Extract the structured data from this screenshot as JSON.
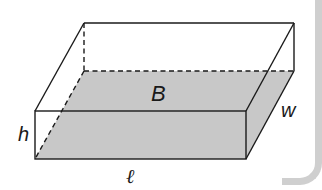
{
  "figure": {
    "labels": {
      "base": "B",
      "width": "w",
      "height": "h",
      "length": "ℓ"
    },
    "colors": {
      "line": "#1a1a1a",
      "base_fill": "#c8c8c8",
      "background": "#ffffff",
      "panel_edge": "#cfcfcf"
    },
    "vertices": {
      "front_top_left": [
        35,
        111
      ],
      "front_top_right": [
        246,
        111
      ],
      "front_bottom_left": [
        35,
        159
      ],
      "front_bottom_right": [
        246,
        159
      ],
      "back_top_left": [
        84,
        23
      ],
      "back_top_right": [
        294,
        23
      ],
      "back_bottom_left": [
        84,
        71
      ],
      "back_bottom_right": [
        294,
        71
      ]
    },
    "hidden_edges": [
      "back_top_left-back_bottom_left",
      "back_bottom_left-back_bottom_right",
      "back_bottom_left-front_bottom_left"
    ]
  }
}
